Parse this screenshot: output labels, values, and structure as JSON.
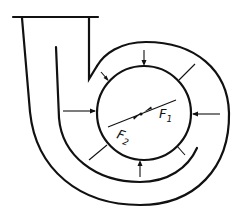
{
  "diagram": {
    "colors": {
      "line": "#111111",
      "background": "#ffffff"
    },
    "labels": {
      "force_1": {
        "letter": "F",
        "subscript": "1"
      },
      "force_2": {
        "letter": "F",
        "subscript": "2"
      }
    },
    "radial_arrows_count": 8
  }
}
